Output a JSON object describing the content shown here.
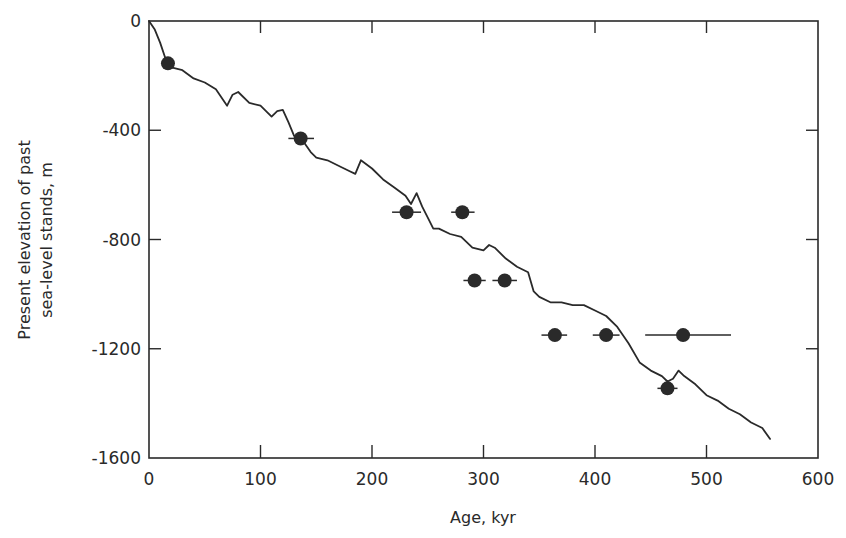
{
  "chart_data": {
    "type": "scatter",
    "title": "",
    "xlabel": "Age, kyr",
    "ylabel_line1": "Present elevation of past",
    "ylabel_line2": "sea-level stands, m",
    "xlim": [
      0,
      600
    ],
    "ylim": [
      -1600,
      0
    ],
    "x_ticks": [
      0,
      100,
      200,
      300,
      400,
      500,
      600
    ],
    "x_tick_labels": [
      "0",
      "100",
      "200",
      "300",
      "400",
      "500",
      "600"
    ],
    "y_ticks": [
      0,
      -400,
      -800,
      -1200,
      -1600
    ],
    "y_tick_labels": [
      "0",
      "-400",
      "-800",
      "-1200",
      "-1600"
    ],
    "grid": false,
    "legend": null,
    "series": [
      {
        "name": "sea-level stands (points with age error bars)",
        "kind": "scatter",
        "points": [
          {
            "x": 17,
            "y": -155,
            "xerr": [
              17,
              17
            ]
          },
          {
            "x": 136,
            "y": -430,
            "xerr": [
              125,
              148
            ]
          },
          {
            "x": 231,
            "y": -700,
            "xerr": [
              218,
              244
            ]
          },
          {
            "x": 281,
            "y": -700,
            "xerr": [
              271,
              292
            ]
          },
          {
            "x": 292,
            "y": -950,
            "xerr": [
              282,
              302
            ]
          },
          {
            "x": 319,
            "y": -950,
            "xerr": [
              308,
              330
            ]
          },
          {
            "x": 364,
            "y": -1150,
            "xerr": [
              352,
              375
            ]
          },
          {
            "x": 410,
            "y": -1150,
            "xerr": [
              398,
              422
            ]
          },
          {
            "x": 479,
            "y": -1150,
            "xerr": [
              445,
              522
            ]
          },
          {
            "x": 465,
            "y": -1345,
            "xerr": [
              456,
              474
            ]
          }
        ]
      },
      {
        "name": "elevation curve",
        "kind": "line",
        "x": [
          0,
          5,
          10,
          15,
          20,
          30,
          40,
          50,
          60,
          70,
          75,
          80,
          90,
          100,
          110,
          115,
          120,
          125,
          130,
          140,
          145,
          150,
          160,
          170,
          180,
          185,
          190,
          200,
          210,
          220,
          230,
          235,
          240,
          245,
          250,
          255,
          260,
          270,
          280,
          290,
          300,
          305,
          310,
          320,
          330,
          340,
          345,
          350,
          360,
          370,
          380,
          390,
          400,
          410,
          420,
          430,
          440,
          450,
          460,
          465,
          470,
          475,
          480,
          490,
          500,
          510,
          520,
          530,
          540,
          550,
          557
        ],
        "y": [
          0,
          -30,
          -80,
          -140,
          -170,
          -180,
          -210,
          -225,
          -250,
          -310,
          -270,
          -260,
          -300,
          -310,
          -350,
          -330,
          -325,
          -370,
          -420,
          -450,
          -480,
          -500,
          -510,
          -530,
          -550,
          -560,
          -510,
          -540,
          -580,
          -610,
          -640,
          -670,
          -630,
          -680,
          -720,
          -760,
          -760,
          -780,
          -790,
          -830,
          -840,
          -820,
          -830,
          -870,
          -900,
          -920,
          -990,
          -1010,
          -1030,
          -1030,
          -1040,
          -1040,
          -1060,
          -1080,
          -1120,
          -1180,
          -1250,
          -1280,
          -1300,
          -1320,
          -1310,
          -1280,
          -1300,
          -1330,
          -1370,
          -1390,
          -1420,
          -1440,
          -1470,
          -1490,
          -1530
        ]
      }
    ]
  },
  "colors": {
    "ink": "#2a2a2a",
    "background": "#ffffff"
  }
}
